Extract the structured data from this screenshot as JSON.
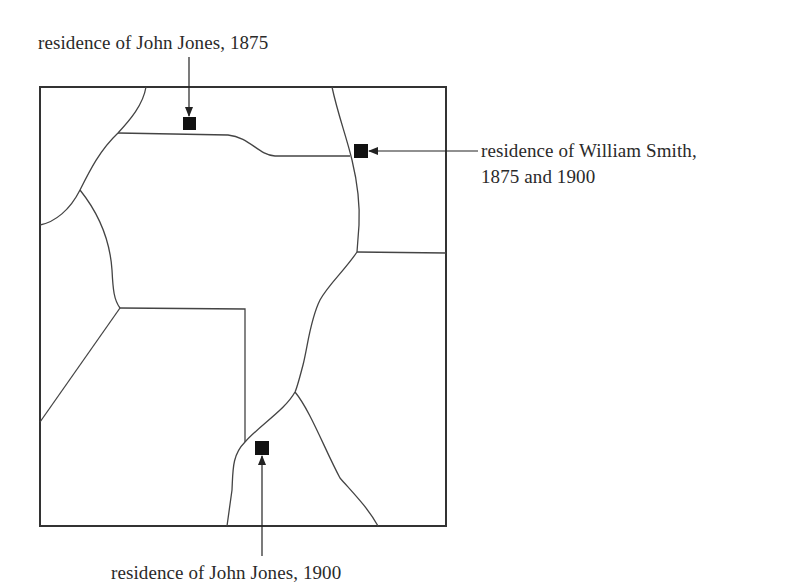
{
  "diagram": {
    "type": "parcel-map",
    "labels": {
      "jones_1875": "residence of John Jones, 1875",
      "smith_line1": "residence of William Smith,",
      "smith_line2": "1875 and 1900",
      "jones_1900": "residence of John Jones, 1900"
    },
    "markers": [
      {
        "id": "jones_1875",
        "label": "residence of John Jones, 1875",
        "x": 189,
        "y": 124
      },
      {
        "id": "smith_1875_1900",
        "label": "residence of William Smith, 1875 and 1900",
        "x": 361,
        "y": 151
      },
      {
        "id": "jones_1900",
        "label": "residence of John Jones, 1900",
        "x": 262,
        "y": 448
      }
    ],
    "colors": {
      "line": "#333333",
      "marker": "#111111",
      "text": "#2a2a2a"
    }
  }
}
